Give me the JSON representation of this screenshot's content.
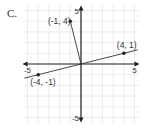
{
  "chart_data": {
    "type": "scatter",
    "title": "C.",
    "xlabel": "",
    "ylabel": "",
    "xlim": [
      -5,
      5
    ],
    "ylim": [
      -5,
      5
    ],
    "grid": true,
    "x_tick_labels": [
      "-5",
      "5"
    ],
    "y_tick_labels": [
      "5",
      "-5"
    ],
    "points": [
      {
        "x": -1,
        "y": 4,
        "label": "(-1, 4)"
      },
      {
        "x": 4,
        "y": 1,
        "label": "(4, 1)"
      },
      {
        "x": -4,
        "y": -1,
        "label": "(-4, -1)"
      }
    ],
    "segments": [
      {
        "from": [
          0,
          0
        ],
        "to": [
          -1,
          4
        ]
      },
      {
        "from": [
          -5.3,
          -1.325
        ],
        "to": [
          5.3,
          1.325
        ]
      }
    ],
    "colors": {
      "grid": "#e4e4e4",
      "axis": "#222222",
      "line": "#333333",
      "text": "#333333"
    }
  }
}
